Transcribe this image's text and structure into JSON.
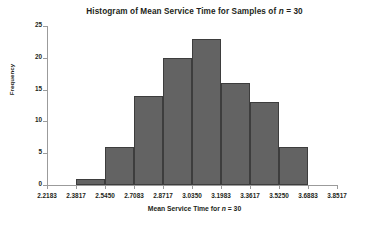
{
  "chart_data": {
    "type": "bar",
    "title": "Histogram of Mean Service Time for Samples of n = 30",
    "title_prefix": "Histogram of Mean Service Time for Samples of ",
    "title_var": "n",
    "title_suffix": " = 30",
    "xlabel": "Mean Service Time for n = 30",
    "xlabel_prefix": "Mean Service Time for ",
    "xlabel_var": "n",
    "xlabel_suffix": " = 30",
    "ylabel": "Frequency",
    "ylim": [
      0,
      25
    ],
    "y_ticks": [
      0,
      5,
      10,
      15,
      20,
      25
    ],
    "y_tick_labels": [
      "0",
      "5",
      "10",
      "15",
      "20",
      "25"
    ],
    "x_tick_labels": [
      "2.2183",
      "2.3817",
      "2.5450",
      "2.7083",
      "2.8717",
      "3.0350",
      "3.1983",
      "3.3617",
      "3.5250",
      "3.6883",
      "3.8517"
    ],
    "x_tick_values": [
      2.2183,
      2.3817,
      2.545,
      2.7083,
      2.8717,
      3.035,
      3.1983,
      3.3617,
      3.525,
      3.6883,
      3.8517
    ],
    "bin_width": 0.16333,
    "grid": false,
    "legend": false,
    "bar_color": "#636363",
    "bar_edge_color": "#3d3d3d",
    "axis_color": "#9b9b9b",
    "bins": [
      {
        "left": "2.3817",
        "right": "2.5450",
        "value": 1
      },
      {
        "left": "2.5450",
        "right": "2.7083",
        "value": 6
      },
      {
        "left": "2.7083",
        "right": "2.8717",
        "value": 14
      },
      {
        "left": "2.8717",
        "right": "3.0350",
        "value": 20
      },
      {
        "left": "3.0350",
        "right": "3.1983",
        "value": 23
      },
      {
        "left": "3.1983",
        "right": "3.3617",
        "value": 16
      },
      {
        "left": "3.3617",
        "right": "3.5250",
        "value": 13
      },
      {
        "left": "3.5250",
        "right": "3.6883",
        "value": 6
      }
    ],
    "categories": [
      "2.3817-2.5450",
      "2.5450-2.7083",
      "2.7083-2.8717",
      "2.8717-3.0350",
      "3.0350-3.1983",
      "3.1983-3.3617",
      "3.3617-3.5250",
      "3.5250-3.6883"
    ],
    "values": [
      1,
      6,
      14,
      20,
      23,
      16,
      13,
      6
    ]
  }
}
